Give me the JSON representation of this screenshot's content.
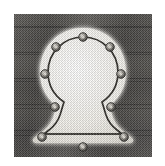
{
  "image": {
    "subject": "keyhole escutcheon plate",
    "medium": "halftone photograph",
    "alt_text": "Light metal keyhole-shaped escutcheon plate with nine rivets mounted on dark wood",
    "width": 165,
    "height": 166
  },
  "frame": {
    "margin_left": 14,
    "margin_top": 14,
    "photo_width": 138,
    "photo_height": 143,
    "page_background": "#ffffff"
  },
  "background": {
    "name": "dark wood panel",
    "base_color": "#4b4a47",
    "shadow_color": "#3a3936",
    "highlight_color": "#5c5a56",
    "grain_line_color": "#262523",
    "grain_line_rows": [
      12,
      38,
      64,
      90,
      116
    ],
    "texture": "halftone dither"
  },
  "plate": {
    "name": "escutcheon-plate",
    "fill_color": "#f3f1ec",
    "edge_glow_color": "#ffffff",
    "outline_color": "#26241f",
    "outline_width": 1.6,
    "dotted_edge_color": "#26241f",
    "shape": "keyhole",
    "bowl_center_x": 69,
    "bowl_center_y": 60,
    "bowl_radius": 36,
    "waist_y": 98,
    "base_y": 126,
    "base_half_width": 44
  },
  "rivets": {
    "name": "rivet",
    "count": 9,
    "body_color": "#6d6a64",
    "rim_color": "#201f1c",
    "center_color": "#d9d6cf",
    "radius": 4.2,
    "positions": [
      {
        "label": "top-center",
        "x": 69,
        "y": 23
      },
      {
        "label": "upper-left",
        "x": 42,
        "y": 33
      },
      {
        "label": "upper-right",
        "x": 96,
        "y": 33
      },
      {
        "label": "mid-left",
        "x": 31,
        "y": 60
      },
      {
        "label": "mid-right",
        "x": 107,
        "y": 60
      },
      {
        "label": "waist-left",
        "x": 41,
        "y": 93
      },
      {
        "label": "waist-right",
        "x": 97,
        "y": 93
      },
      {
        "label": "bottom-left",
        "x": 28,
        "y": 123
      },
      {
        "label": "bottom-right",
        "x": 110,
        "y": 123
      },
      {
        "label": "bottom-center",
        "x": 69,
        "y": 133
      }
    ]
  }
}
